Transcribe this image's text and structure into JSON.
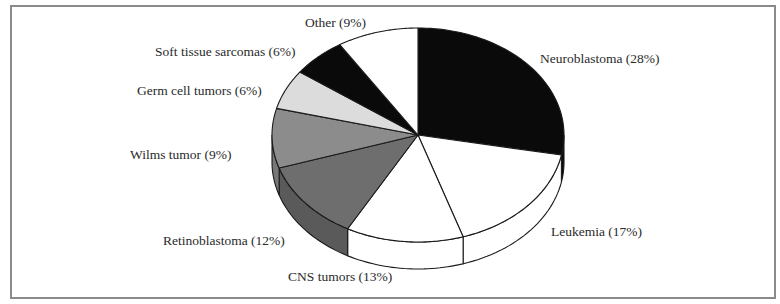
{
  "chart_data": {
    "type": "pie",
    "style": "3d-pie",
    "title": "",
    "categories": [
      "Neuroblastoma",
      "Leukemia",
      "CNS tumors",
      "Retinoblastoma",
      "Wilms tumor",
      "Germ cell tumors",
      "Soft tissue sarcomas",
      "Other"
    ],
    "values": [
      28,
      17,
      13,
      12,
      9,
      6,
      6,
      9
    ],
    "unit": "%",
    "colors": [
      "#0a0a0a",
      "#ffffff",
      "#ffffff",
      "#6e6e6e",
      "#8c8c8c",
      "#dcdcdc",
      "#0a0a0a",
      "#ffffff"
    ],
    "side_colors": [
      "#0a0a0a",
      "#ffffff",
      "#ffffff",
      "#5a5a5a",
      "#777777",
      "#c8c8c8",
      "#0a0a0a",
      "#ffffff"
    ],
    "labels": [
      "Neuroblastoma (28%)",
      "Leukemia (17%)",
      "CNS tumors (13%)",
      "Retinoblastoma (12%)",
      "Wilms tumor (9%)",
      "Germ cell tumors (6%)",
      "Soft tissue sarcomas (6%)",
      "Other (9%)"
    ],
    "start_angle": "12 o'clock",
    "direction": "clockwise",
    "legend": "none (direct labels)"
  },
  "geometry": {
    "cx": 418,
    "cy": 135,
    "rx": 146,
    "ry": 107,
    "depth": 27
  },
  "label_positions": [
    {
      "x": 540,
      "y": 52
    },
    {
      "x": 551,
      "y": 225
    },
    {
      "x": 288,
      "y": 270
    },
    {
      "x": 163,
      "y": 234
    },
    {
      "x": 130,
      "y": 148
    },
    {
      "x": 137,
      "y": 84
    },
    {
      "x": 155,
      "y": 45
    },
    {
      "x": 305,
      "y": 16
    }
  ]
}
